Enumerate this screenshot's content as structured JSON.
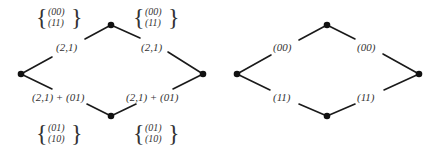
{
  "diagrams": [
    {
      "id": "left",
      "edge_labels": {
        "top_left": "(2,1)",
        "top_right": "(2,1)",
        "bottom_left": "(2,1) + (01)",
        "bottom_right": "(2,1) + (01)"
      },
      "sets": {
        "top_left": [
          "(00)",
          "(11)"
        ],
        "top_right": [
          "(00)",
          "(11)"
        ],
        "bottom_left": [
          "(01)",
          "(10)"
        ],
        "bottom_right": [
          "(01)",
          "(10)"
        ]
      }
    },
    {
      "id": "right",
      "edge_labels": {
        "top_left": "(00)",
        "top_right": "(00)",
        "bottom_left": "(11)",
        "bottom_right": "(11)"
      }
    }
  ],
  "braces": {
    "open": "{",
    "close": "}"
  }
}
